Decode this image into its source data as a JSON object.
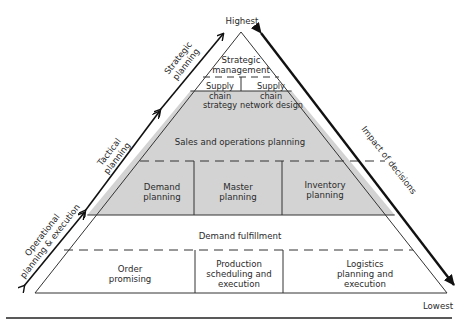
{
  "diagram": {
    "type": "pyramid",
    "top_label": "Highest",
    "bottom_label": "Lowest",
    "right_axis_label": "Impact of decisions",
    "left_axis_segments": [
      {
        "label_line1": "Strategic",
        "label_line2": "planning"
      },
      {
        "label_line1": "Tactical",
        "label_line2": "planning"
      },
      {
        "label_line1": "Operational",
        "label_line2": "planning & execution"
      }
    ],
    "levels": {
      "strategic": {
        "header": {
          "line1": "Strategic",
          "line2": "management"
        },
        "cells": [
          {
            "line1": "Supply",
            "line2": "chain",
            "line3": "strategy"
          },
          {
            "line1": "Supply",
            "line2": "chain",
            "line3": "network design"
          }
        ]
      },
      "tactical": {
        "header": "Sales and operations planning",
        "fill_color": "#d3d3d3",
        "cells": [
          {
            "line1": "Demand",
            "line2": "planning"
          },
          {
            "line1": "Master",
            "line2": "planning"
          },
          {
            "line1": "Inventory",
            "line2": "planning"
          }
        ]
      },
      "operational": {
        "header": "Demand fulfillment",
        "cells": [
          {
            "line1": "Order",
            "line2": "promising"
          },
          {
            "line1": "Production",
            "line2": "scheduling and",
            "line3": "execution"
          },
          {
            "line1": "Logistics",
            "line2": "planning and",
            "line3": "execution"
          }
        ]
      }
    }
  }
}
